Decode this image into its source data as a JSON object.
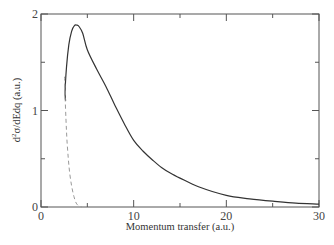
{
  "chart_data": {
    "type": "line",
    "title": "",
    "xlabel": "Momentum transfer (a.u.)",
    "ylabel": "d²σ/dEdq (a.u.)",
    "ylabel_parts": {
      "prefix": "d",
      "sup": "2",
      "rest": "σ/dEdq (a.u.)"
    },
    "xlim": [
      0,
      30
    ],
    "ylim": [
      0,
      2
    ],
    "xticks_major": [
      0,
      10,
      20,
      30
    ],
    "xticks_minor": [
      5,
      15,
      25
    ],
    "yticks_major": [
      0,
      1,
      2
    ],
    "yticks_minor": [
      0.5,
      1.5
    ],
    "xtick_labels": [
      "0",
      "10",
      "20",
      "30"
    ],
    "ytick_labels": [
      "0",
      "1",
      "2"
    ],
    "grid": false,
    "legend": null,
    "series": [
      {
        "name": "solid",
        "style": "solid",
        "color": "#333333",
        "x": [
          2.65,
          2.6,
          2.75,
          3.0,
          3.3,
          3.6,
          3.85,
          4.1,
          4.5,
          5.0,
          6.0,
          7.0,
          8.0,
          9.0,
          10.0,
          11.0,
          12.0,
          13.0,
          14.0,
          15.0,
          17.0,
          20.0,
          22.5,
          25.0,
          27.5,
          30.0
        ],
        "y": [
          1.1,
          1.2,
          1.45,
          1.68,
          1.82,
          1.88,
          1.885,
          1.87,
          1.8,
          1.63,
          1.43,
          1.25,
          1.05,
          0.86,
          0.69,
          0.58,
          0.49,
          0.41,
          0.35,
          0.3,
          0.21,
          0.12,
          0.085,
          0.06,
          0.04,
          0.03
        ]
      },
      {
        "name": "dashed",
        "style": "dashed",
        "color": "#999999",
        "x": [
          2.55,
          2.6,
          2.7,
          2.8,
          2.95,
          3.1,
          3.3,
          3.55,
          3.8,
          4.1,
          4.4
        ],
        "y": [
          1.35,
          1.15,
          0.9,
          0.7,
          0.5,
          0.35,
          0.22,
          0.11,
          0.04,
          0.01,
          0.0
        ]
      }
    ]
  }
}
